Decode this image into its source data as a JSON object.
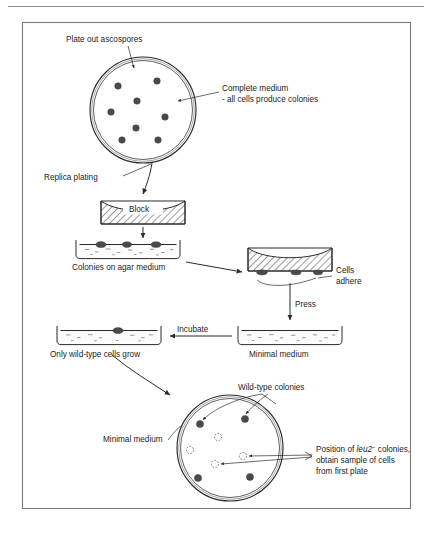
{
  "figure": {
    "background": "#ffffff",
    "ink_color": "#2b2b2b",
    "frame_color": "#7b7b7b"
  },
  "labels": {
    "plate_out": "Plate out ascospores",
    "complete_medium_line1": "Complete medium",
    "complete_medium_line2": "- all cells produce colonies",
    "replica_plating": "Replica plating",
    "block": "Block",
    "colonies_on_agar": "Colonies on agar medium",
    "cells_line1": "Cells",
    "cells_line2": "adhere",
    "press": "Press",
    "minimal_medium_mid": "Minimal medium",
    "incubate": "Incubate",
    "only_wild_type": "Only wild-type cells grow",
    "wild_type_colonies": "Wild-type colonies",
    "minimal_medium_bottom": "Minimal medium",
    "position_prefix": "Position of ",
    "position_gene": "leu2",
    "position_superscript": "−",
    "position_suffix": " colonies,",
    "position_line2": "obtain sample of cells",
    "position_line3": "from first plate"
  },
  "top_plate": {
    "name": "complete-medium-plate",
    "center": [
      143,
      110
    ],
    "radius_outer": 53,
    "radius_inner": 49.5,
    "colony_radius": 3.3,
    "colonies": [
      [
        118,
        86
      ],
      [
        157,
        81
      ],
      [
        137,
        101
      ],
      [
        111,
        112
      ],
      [
        165,
        117
      ],
      [
        136,
        128
      ],
      [
        122,
        140
      ],
      [
        158,
        140
      ]
    ]
  },
  "agar_plate_1": {
    "name": "colonies-on-agar-plate",
    "x": 76,
    "y": 240,
    "width": 104,
    "height": 17,
    "colonies_x": [
      101,
      127,
      156
    ],
    "colony_dome_ry": 3.0
  },
  "block_down": {
    "name": "replica-block",
    "x": 101,
    "y": 201,
    "width": 84,
    "height": 23
  },
  "block_inverted": {
    "name": "inverted-block-with-cells",
    "x": 248,
    "y": 248,
    "width": 84,
    "height": 23
  },
  "agar_plate_minimal": {
    "name": "minimal-medium-plate",
    "x": 238,
    "y": 326,
    "width": 104,
    "height": 17
  },
  "agar_plate_grown": {
    "name": "wild-type-growth-plate",
    "x": 57,
    "y": 326,
    "width": 104,
    "height": 17,
    "colonies_x": [
      118
    ]
  },
  "bottom_plate": {
    "name": "minimal-medium-result-plate",
    "center": [
      230,
      448
    ],
    "radius_outer": 53,
    "radius_inner": 49.5,
    "colony_radius": 3.6,
    "ghost_radius": 3.6,
    "wild_type_colonies": [
      [
        200,
        424
      ],
      [
        245,
        419
      ],
      [
        198,
        478
      ],
      [
        250,
        477
      ]
    ],
    "leu2_positions": [
      [
        218,
        437
      ],
      [
        190,
        450
      ],
      [
        243,
        456
      ],
      [
        215,
        464
      ]
    ]
  },
  "legend": {
    "filled_meaning": "Wild-type colonies (grow on minimal medium)",
    "dashed_meaning": "Position of leu2 colonies (no growth)"
  }
}
